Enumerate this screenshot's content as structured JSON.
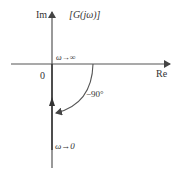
{
  "diagram": {
    "title_label": "[G(jω)]",
    "axes": {
      "imag_label": "Im",
      "real_label": "Re",
      "origin_label": "0"
    },
    "annotations": {
      "omega_infinity": "ω→∞",
      "omega_zero": "ω→0",
      "angle": "−90°"
    },
    "colors": {
      "axis": "#555555",
      "plot": "#3a3a3a",
      "background": "#ffffff"
    }
  }
}
